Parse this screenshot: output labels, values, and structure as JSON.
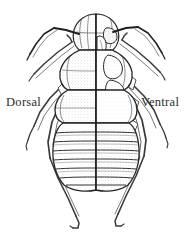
{
  "figure": {
    "background_color": "#ffffff",
    "ink_color": "#262626",
    "mid_tone_color": "#6e6e6e",
    "shading_color": "#cfcfcf",
    "light_shading_color": "#e6e6e6",
    "labels": {
      "left": "Dorsal",
      "right": "Ventral"
    },
    "anatomy": {
      "head_label": "head",
      "thorax_label": "thorax",
      "abdomen_label": "abdomen",
      "antenna_label": "antenna",
      "leg_label": "leg",
      "midline_label": "sagittal-midline",
      "abdominal_segment_count": 7,
      "leg_pair_count": 3
    }
  }
}
